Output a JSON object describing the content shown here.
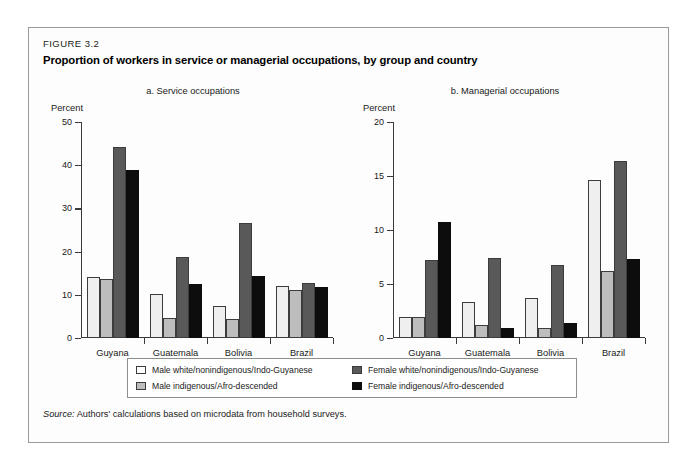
{
  "figure": {
    "label": "FIGURE 3.2",
    "title": "Proportion of workers in service or managerial occupations, by group and country",
    "source_label": "Source:",
    "source_text": "Authors' calculations based on microdata from household surveys."
  },
  "legend": {
    "items": [
      {
        "key": "male-white",
        "label": "Male white/nonindigenous/Indo-Guyanese",
        "color": "#ffffff"
      },
      {
        "key": "female-white",
        "label": "Female white/nonindigenous/Indo-Guyanese",
        "color": "#595959"
      },
      {
        "key": "male-indigenous",
        "label": "Male indigenous/Afro-descended",
        "color": "#bdbdbd"
      },
      {
        "key": "female-indigenous",
        "label": "Female indigenous/Afro-descended",
        "color": "#0d0d0d"
      }
    ]
  },
  "chart_data": [
    {
      "type": "bar",
      "panel": "a",
      "title": "a. Service occupations",
      "xlabel": "",
      "ylabel": "Percent",
      "ylim": [
        0,
        50
      ],
      "yticks": [
        0,
        10,
        20,
        30,
        40,
        50
      ],
      "grid": false,
      "legend_position": "bottom",
      "categories": [
        "Guyana",
        "Guatemala",
        "Bolivia",
        "Brazil"
      ],
      "series": [
        {
          "name": "Male white/nonindigenous/Indo-Guyanese",
          "values": [
            14.1,
            10.1,
            7.3,
            12.1
          ]
        },
        {
          "name": "Male indigenous/Afro-descended",
          "values": [
            13.7,
            4.7,
            4.4,
            11.2
          ]
        },
        {
          "name": "Female white/nonindigenous/Indo-Guyanese",
          "values": [
            44.3,
            18.8,
            26.7,
            12.8
          ]
        },
        {
          "name": "Female indigenous/Afro-descended",
          "values": [
            38.9,
            12.4,
            14.4,
            11.9
          ]
        }
      ]
    },
    {
      "type": "bar",
      "panel": "b",
      "title": "b. Managerial occupations",
      "xlabel": "",
      "ylabel": "Percent",
      "ylim": [
        0,
        20
      ],
      "yticks": [
        0,
        5,
        10,
        15,
        20
      ],
      "grid": false,
      "legend_position": "bottom",
      "categories": [
        "Guyana",
        "Guatemala",
        "Bolivia",
        "Brazil"
      ],
      "series": [
        {
          "name": "Male white/nonindigenous/Indo-Guyanese",
          "values": [
            1.9,
            3.3,
            3.7,
            14.6
          ]
        },
        {
          "name": "Male indigenous/Afro-descended",
          "values": [
            1.9,
            1.2,
            0.9,
            6.2
          ]
        },
        {
          "name": "Female white/nonindigenous/Indo-Guyanese",
          "values": [
            7.2,
            7.4,
            6.8,
            16.4
          ]
        },
        {
          "name": "Female indigenous/Afro-descended",
          "values": [
            10.7,
            0.9,
            1.4,
            7.3
          ]
        }
      ]
    }
  ]
}
